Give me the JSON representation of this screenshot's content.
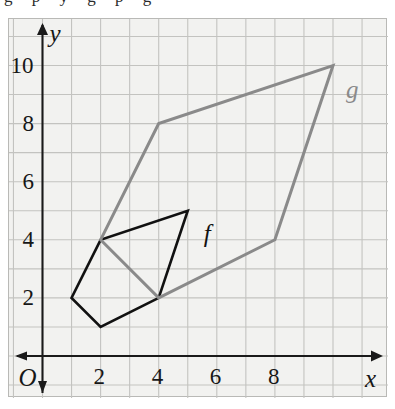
{
  "figure": {
    "scan_artifact_text": "g p y g p g",
    "background_color": "#f2f2f0",
    "grid_color": "#c3c3c0",
    "border_color": "#b9b9b6"
  },
  "axes": {
    "origin_label": "O",
    "x_axis_label": "x",
    "y_axis_label": "y",
    "axis_color": "#1a1a1a",
    "x_ticks": [
      "2",
      "4",
      "6",
      "8"
    ],
    "y_ticks": [
      "2",
      "4",
      "6",
      "8",
      "10"
    ],
    "x_range": [
      0,
      12
    ],
    "y_range": [
      0,
      11
    ]
  },
  "chart_data": {
    "type": "scatter",
    "title": "",
    "xlabel": "x",
    "ylabel": "y",
    "xlim": [
      0,
      12
    ],
    "ylim": [
      0,
      11
    ],
    "grid": true,
    "legend": "none",
    "series": [
      {
        "name": "f",
        "label": "f",
        "color": "#111111",
        "closed": true,
        "x": [
          1,
          2,
          5,
          4,
          2
        ],
        "y": [
          2,
          4,
          5,
          2,
          1
        ],
        "vertices": [
          [
            1,
            2
          ],
          [
            2,
            4
          ],
          [
            5,
            5
          ],
          [
            4,
            2
          ],
          [
            2,
            1
          ]
        ],
        "label_position": [
          5.55,
          4.65
        ]
      },
      {
        "name": "g",
        "label": "g",
        "color": "#8a8a8a",
        "closed": true,
        "x": [
          2,
          4,
          10,
          8,
          4
        ],
        "y": [
          4,
          8,
          10,
          4,
          2
        ],
        "vertices": [
          [
            2,
            4
          ],
          [
            4,
            8
          ],
          [
            10,
            10
          ],
          [
            8,
            4
          ],
          [
            4,
            2
          ]
        ],
        "label_position": [
          10.45,
          9.6
        ]
      }
    ]
  }
}
